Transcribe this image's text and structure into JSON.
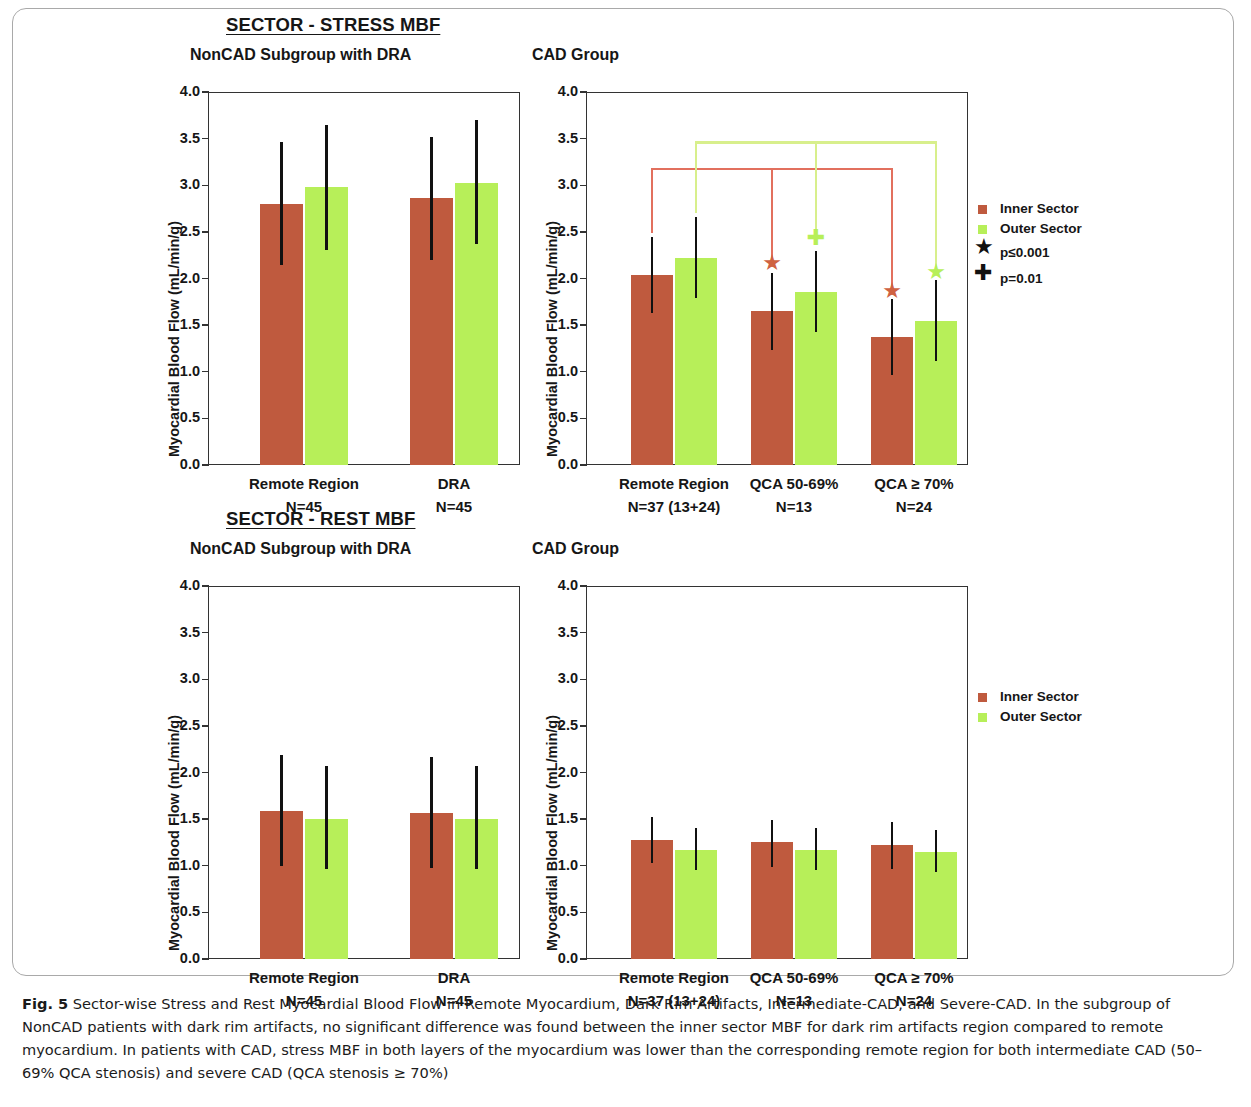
{
  "figure": {
    "caption_label": "Fig. 5",
    "caption_text": " Sector-wise Stress and Rest Myocardial Blood Flow in Remote Myocardium, Dark Rim Artifacts, Intermediate-CAD, and Severe-CAD. In the subgroup of NonCAD patients with dark rim artifacts, no significant difference was found between the inner sector MBF for dark rim artifacts region compared to remote myocardium. In patients with CAD, stress MBF in both layers of the myocardium was lower than the corresponding remote region for both intermediate CAD (50–69% QCA stenosis) and severe CAD (QCA stenosis ≥ 70%)"
  },
  "sections": {
    "stress_title": "SECTOR - STRESS MBF",
    "rest_title": "SECTOR - REST MBF",
    "noncad_panel_title": "NonCAD Subgroup with DRA",
    "cad_panel_title": "CAD Group"
  },
  "legend": {
    "inner_label": "Inner Sector",
    "outer_label": "Outer Sector",
    "star_label": "p≤0.001",
    "cross_label": "p=0.01",
    "star_glyph": "★",
    "cross_glyph": "✚",
    "inner_color": "#bf5a3e",
    "outer_color": "#b7ef59"
  },
  "chart_data": [
    {
      "id": "stress-noncad",
      "type": "bar",
      "title": "NonCAD Subgroup with DRA",
      "section": "SECTOR - STRESS MBF",
      "ylabel": "Myocardial Blood Flow (mL/min/g)",
      "xlabel": "",
      "ylim": [
        0.0,
        4.0
      ],
      "yticks": [
        "0.0",
        "0.5",
        "1.0",
        "1.5",
        "2.0",
        "2.5",
        "3.0",
        "3.5",
        "4.0"
      ],
      "grid": false,
      "legend_position": "none",
      "categories": [
        "Remote Region",
        "DRA"
      ],
      "category_counts": [
        "N=45",
        "N=45"
      ],
      "series": [
        {
          "name": "Inner Sector",
          "color": "#bf5a3e",
          "values": [
            2.8,
            2.86
          ],
          "err_low": [
            2.14,
            2.2
          ],
          "err_high": [
            3.46,
            3.52
          ]
        },
        {
          "name": "Outer Sector",
          "color": "#b7ef59",
          "values": [
            2.98,
            3.02
          ],
          "err_low": [
            2.31,
            2.37
          ],
          "err_high": [
            3.65,
            3.7
          ]
        }
      ],
      "annotations": []
    },
    {
      "id": "stress-cad",
      "type": "bar",
      "title": "CAD Group",
      "section": "SECTOR - STRESS MBF",
      "ylabel": "Myocardial Blood Flow (mL/min/g)",
      "xlabel": "",
      "ylim": [
        0.0,
        4.0
      ],
      "yticks": [
        "0.0",
        "0.5",
        "1.0",
        "1.5",
        "2.0",
        "2.5",
        "3.0",
        "3.5",
        "4.0"
      ],
      "grid": false,
      "legend_position": "right",
      "categories": [
        "Remote Region",
        "QCA 50-69%",
        "QCA ≥ 70%"
      ],
      "category_counts": [
        "N=37 (13+24)",
        "N=13",
        "N=24"
      ],
      "series": [
        {
          "name": "Inner Sector",
          "color": "#bf5a3e",
          "values": [
            2.04,
            1.65,
            1.37
          ],
          "err_low": [
            1.63,
            1.23,
            0.96
          ],
          "err_high": [
            2.44,
            2.06,
            1.78
          ]
        },
        {
          "name": "Outer Sector",
          "color": "#b7ef59",
          "values": [
            2.22,
            1.86,
            1.54
          ],
          "err_low": [
            1.79,
            1.43,
            1.11
          ],
          "err_high": [
            2.66,
            2.29,
            1.98
          ]
        }
      ],
      "annotations": [
        {
          "marker": "star",
          "series": "Inner Sector",
          "category": "QCA 50-69%",
          "value": 2.17,
          "color": "#cf6242",
          "p": "p≤0.001"
        },
        {
          "marker": "star",
          "series": "Inner Sector",
          "category": "QCA ≥ 70%",
          "value": 1.87,
          "color": "#cf6242",
          "p": "p≤0.001"
        },
        {
          "marker": "cross",
          "series": "Outer Sector",
          "category": "QCA 50-69%",
          "value": 2.43,
          "color": "#b7ef59",
          "p": "p=0.01"
        },
        {
          "marker": "star",
          "series": "Outer Sector",
          "category": "QCA ≥ 70%",
          "value": 2.07,
          "color": "#b7ef59",
          "p": "p≤0.001"
        }
      ],
      "brackets": [
        {
          "series": "Inner Sector",
          "level": 3.19,
          "color": "#e2705e",
          "from": "Remote Region",
          "to": [
            "QCA 50-69%",
            "QCA ≥ 70%"
          ]
        },
        {
          "series": "Outer Sector",
          "level": 3.47,
          "color": "#d8ef8c",
          "from": "Remote Region",
          "to": [
            "QCA 50-69%",
            "QCA ≥ 70%"
          ]
        }
      ]
    },
    {
      "id": "rest-noncad",
      "type": "bar",
      "title": "NonCAD Subgroup with DRA",
      "section": "SECTOR - REST MBF",
      "ylabel": "Myocardial Blood Flow (mL/min/g)",
      "xlabel": "",
      "ylim": [
        0.0,
        4.0
      ],
      "yticks": [
        "0.0",
        "0.5",
        "1.0",
        "1.5",
        "2.0",
        "2.5",
        "3.0",
        "3.5",
        "4.0"
      ],
      "grid": false,
      "legend_position": "none",
      "categories": [
        "Remote Region",
        "DRA"
      ],
      "category_counts": [
        "N=45",
        "N=45"
      ],
      "series": [
        {
          "name": "Inner Sector",
          "color": "#bf5a3e",
          "values": [
            1.59,
            1.57
          ],
          "err_low": [
            1.0,
            0.98
          ],
          "err_high": [
            2.19,
            2.17
          ]
        },
        {
          "name": "Outer Sector",
          "color": "#b7ef59",
          "values": [
            1.5,
            1.5
          ],
          "err_low": [
            0.96,
            0.96
          ],
          "err_high": [
            2.07,
            2.07
          ]
        }
      ],
      "annotations": []
    },
    {
      "id": "rest-cad",
      "type": "bar",
      "title": "CAD Group",
      "section": "SECTOR - REST MBF",
      "ylabel": "Myocardial Blood Flow (mL/min/g)",
      "xlabel": "",
      "ylim": [
        0.0,
        4.0
      ],
      "yticks": [
        "0.0",
        "0.5",
        "1.0",
        "1.5",
        "2.0",
        "2.5",
        "3.0",
        "3.5",
        "4.0"
      ],
      "grid": false,
      "legend_position": "right",
      "categories": [
        "Remote Region",
        "QCA 50-69%",
        "QCA ≥ 70%"
      ],
      "category_counts": [
        "N=37 (13+24)",
        "N=13",
        "N=24"
      ],
      "series": [
        {
          "name": "Inner Sector",
          "color": "#bf5a3e",
          "values": [
            1.28,
            1.25,
            1.22
          ],
          "err_low": [
            1.03,
            0.99,
            0.97
          ],
          "err_high": [
            1.52,
            1.49,
            1.47
          ]
        },
        {
          "name": "Outer Sector",
          "color": "#b7ef59",
          "values": [
            1.17,
            1.17,
            1.15
          ],
          "err_low": [
            0.95,
            0.95,
            0.93
          ],
          "err_high": [
            1.4,
            1.41,
            1.38
          ]
        }
      ],
      "annotations": []
    }
  ]
}
